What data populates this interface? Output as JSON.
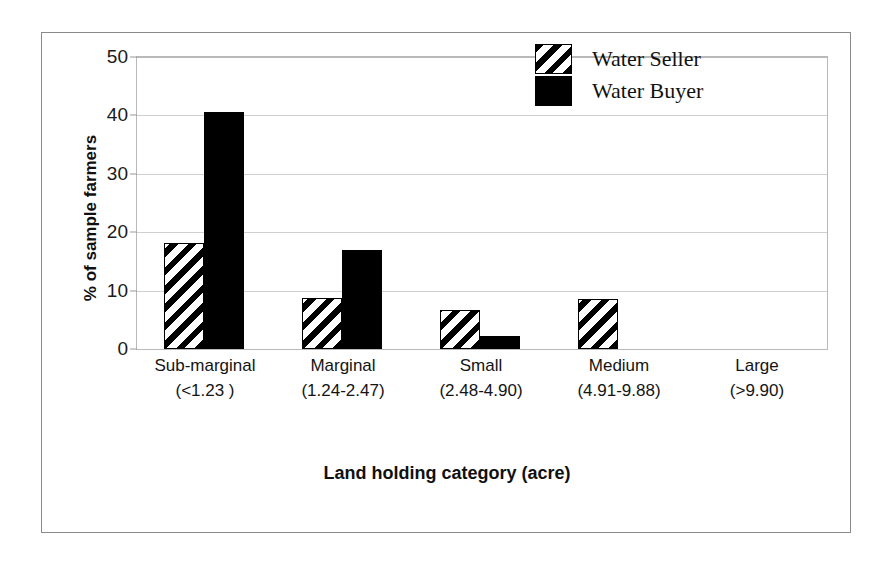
{
  "chart_data": {
    "type": "bar",
    "title": "",
    "xlabel": "Land holding category (acre)",
    "ylabel": "% of sample farmers",
    "ylim": [
      0,
      50
    ],
    "yticks": [
      0,
      10,
      20,
      30,
      40,
      50
    ],
    "grid": true,
    "legend_position": "top-right",
    "categories": [
      "Sub-marginal",
      "Marginal",
      "Small",
      "Medium",
      "Large"
    ],
    "category_ranges": [
      "(<1.23 )",
      "(1.24-2.47)",
      "(2.48-4.90)",
      "(4.91-9.88)",
      "(>9.90)"
    ],
    "series": [
      {
        "name": "Water Seller",
        "fill": "diagonal-hatch",
        "color": "#000000",
        "values": [
          18.1,
          8.7,
          6.6,
          8.6,
          0
        ]
      },
      {
        "name": "Water Buyer",
        "fill": "solid",
        "color": "#000000",
        "values": [
          40.5,
          17.0,
          2.2,
          0,
          0
        ]
      }
    ]
  },
  "legend": {
    "items": [
      {
        "label": "Water Seller",
        "swatch": "hatched-swatch-icon"
      },
      {
        "label": "Water Buyer",
        "swatch": "solid-black-swatch-icon"
      }
    ]
  },
  "axis": {
    "y_tick_labels": [
      "0",
      "10",
      "20",
      "30",
      "40",
      "50"
    ],
    "y_title": "% of sample farmers",
    "x_title": "Land holding category (acre)"
  },
  "colors": {
    "frame": "#8a8a8a",
    "plot_border": "#b9b9b9",
    "gridline": "#cfcfcf",
    "bar": "#000000",
    "background": "#ffffff",
    "text": "#101010"
  }
}
